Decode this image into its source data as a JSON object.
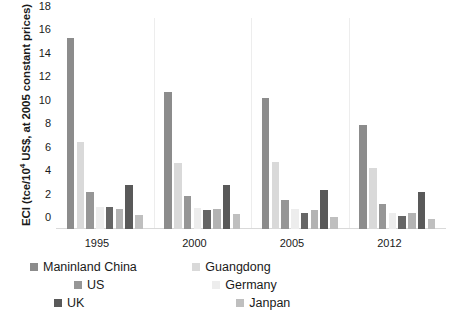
{
  "chart_data": {
    "type": "bar",
    "title": "",
    "xlabel": "",
    "ylabel": "ECI (tce/10⁴ US$, at 2005 constant prices)",
    "ylabel_prefix": "ECI (tce/10",
    "ylabel_exp": "4",
    "ylabel_suffix": " US$, at 2005 constant prices)",
    "categories": [
      "1995",
      "2000",
      "2005",
      "2012"
    ],
    "ylim": [
      0,
      18
    ],
    "yticks": [
      0,
      2,
      4,
      6,
      8,
      10,
      12,
      14,
      16,
      18
    ],
    "grid": false,
    "legend_position": "bottom",
    "series": [
      {
        "name": "Maninland China",
        "color": "#8c8c8c",
        "values": [
          16.3,
          11.7,
          11.2,
          8.9
        ]
      },
      {
        "name": "Guangdong",
        "color": "#d9d9d9",
        "values": [
          7.45,
          5.65,
          5.7,
          5.2
        ]
      },
      {
        "name": "US",
        "color": "#969696",
        "values": [
          3.15,
          2.8,
          2.5,
          2.1
        ]
      },
      {
        "name": "Germany",
        "color": "#ededed",
        "values": [
          1.85,
          1.8,
          1.75,
          1.4
        ]
      },
      {
        "name": "UK",
        "color": "#666666",
        "values": [
          1.9,
          1.65,
          1.4,
          1.15
        ]
      },
      {
        "name": "Janpan",
        "color": "#b3b3b3",
        "values": [
          1.75,
          1.75,
          1.65,
          1.35
        ]
      },
      {
        "name": "UK",
        "color": "#595959",
        "values": [
          3.75,
          3.75,
          3.3,
          3.15
        ]
      },
      {
        "name": "Janpan",
        "color": "#bfbfbf",
        "values": [
          1.2,
          1.3,
          1.0,
          0.85
        ]
      }
    ]
  },
  "legend": {
    "items": [
      {
        "label": "Maninland China",
        "color": "#8c8c8c"
      },
      {
        "label": "Guangdong",
        "color": "#d9d9d9"
      },
      {
        "label": "US",
        "color": "#969696"
      },
      {
        "label": "Germany",
        "color": "#ededed"
      },
      {
        "label": "UK",
        "color": "#595959"
      },
      {
        "label": "Janpan",
        "color": "#bfbfbf"
      }
    ]
  }
}
